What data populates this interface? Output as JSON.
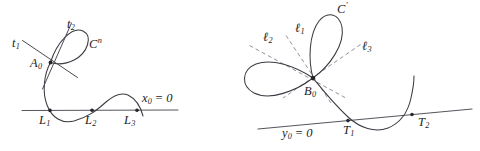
{
  "figure": {
    "kind": "mathematical-diagram",
    "background_color": "#ffffff",
    "curve_color": "#3a3a42",
    "dashed_color": "#8c8c96",
    "node_color": "#25252b"
  },
  "left_panel": {
    "name": "left-diagram",
    "curve_label": {
      "base": "C",
      "sup": "n"
    },
    "node_label": {
      "base": "A",
      "sub": "0"
    },
    "tangents": [
      {
        "base": "t",
        "sub": "1"
      },
      {
        "base": "t",
        "sub": "2"
      }
    ],
    "axis_label": {
      "var": "x",
      "sub": "0",
      "eq": " = 0"
    },
    "intersections": [
      {
        "base": "L",
        "sub": "1"
      },
      {
        "base": "L",
        "sub": "2"
      },
      {
        "base": "L",
        "sub": "3"
      }
    ]
  },
  "right_panel": {
    "name": "right-diagram",
    "curve_label": {
      "base": "C",
      "prime": "′"
    },
    "node_label": {
      "base": "B",
      "sub": "0"
    },
    "tangents": [
      {
        "base": "ℓ",
        "sub": "1"
      },
      {
        "base": "ℓ",
        "sub": "2"
      },
      {
        "base": "ℓ",
        "sub": "3"
      }
    ],
    "axis_label": {
      "var": "y",
      "sub": "0",
      "eq": " = 0"
    },
    "intersections": [
      {
        "base": "T",
        "sub": "1"
      },
      {
        "base": "T",
        "sub": "2"
      }
    ]
  }
}
